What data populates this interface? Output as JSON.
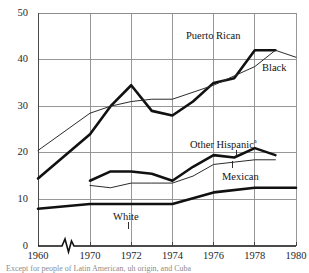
{
  "figure": {
    "title": "",
    "footnote": "Except for people of Latin American, uh origin, and Cuba"
  },
  "axes": {
    "y": {
      "label": "",
      "min": 0,
      "max": 50,
      "ticks": [
        0,
        10,
        20,
        30,
        40,
        50
      ]
    },
    "x": {
      "label": "",
      "min": 1960,
      "max": 1980,
      "ticks": [
        1960,
        1970,
        1972,
        1974,
        1976,
        1978,
        1980
      ],
      "axis_break": true
    },
    "grid": true,
    "gridline_color": "#8c8c8c"
  },
  "labels": {
    "puerto_rican": "Puerto Rican",
    "black": "Black",
    "other_hispanic": "Other Hispanic",
    "other_hispanic_marker": "a",
    "mexican": "Mexican",
    "white": "White"
  },
  "chart_data": {
    "type": "line",
    "title": "",
    "xlabel": "",
    "ylabel": "",
    "xlim": [
      1960,
      1980
    ],
    "ylim": [
      0,
      50
    ],
    "xticks": [
      1960,
      1970,
      1972,
      1974,
      1976,
      1978,
      1980
    ],
    "yticks": [
      0,
      10,
      20,
      30,
      40,
      50
    ],
    "grid": true,
    "legend": "inline-labels",
    "axis_break_between": [
      1960,
      1970
    ],
    "series": [
      {
        "name": "Puerto Rican",
        "style": "thick",
        "color": "#111111",
        "x": [
          1960,
          1970,
          1971,
          1972,
          1973,
          1974,
          1975,
          1976,
          1977,
          1978,
          1979
        ],
        "values": [
          14.5,
          24.0,
          30.0,
          34.5,
          29.0,
          28.0,
          31.0,
          35.0,
          36.0,
          42.0,
          42.0
        ]
      },
      {
        "name": "Black",
        "style": "thin",
        "color": "#2b2b2b",
        "x": [
          1960,
          1970,
          1971,
          1972,
          1973,
          1974,
          1975,
          1976,
          1977,
          1978,
          1979,
          1980
        ],
        "values": [
          20.5,
          28.5,
          30.0,
          31.0,
          31.5,
          31.5,
          33.0,
          34.5,
          36.5,
          38.5,
          42.0,
          40.5
        ]
      },
      {
        "name": "Other Hispanic",
        "style": "thick",
        "color": "#111111",
        "x": [
          1970,
          1971,
          1972,
          1973,
          1974,
          1975,
          1976,
          1977,
          1978,
          1979
        ],
        "values": [
          14.0,
          16.0,
          16.0,
          15.5,
          14.0,
          17.0,
          19.5,
          19.0,
          21.0,
          19.5
        ]
      },
      {
        "name": "Mexican",
        "style": "thin",
        "color": "#2b2b2b",
        "x": [
          1970,
          1971,
          1972,
          1973,
          1974,
          1975,
          1976,
          1977,
          1978,
          1979
        ],
        "values": [
          13.0,
          12.5,
          13.5,
          13.5,
          13.5,
          15.0,
          17.5,
          18.0,
          18.5,
          18.5
        ]
      },
      {
        "name": "White",
        "style": "thick",
        "color": "#111111",
        "x": [
          1960,
          1970,
          1972,
          1974,
          1976,
          1978,
          1980
        ],
        "values": [
          8.0,
          9.0,
          9.0,
          9.0,
          11.5,
          12.5,
          12.5
        ]
      }
    ]
  },
  "geometry": {
    "plot": {
      "left": 38,
      "right": 296,
      "top": 13,
      "bottom": 246
    }
  }
}
